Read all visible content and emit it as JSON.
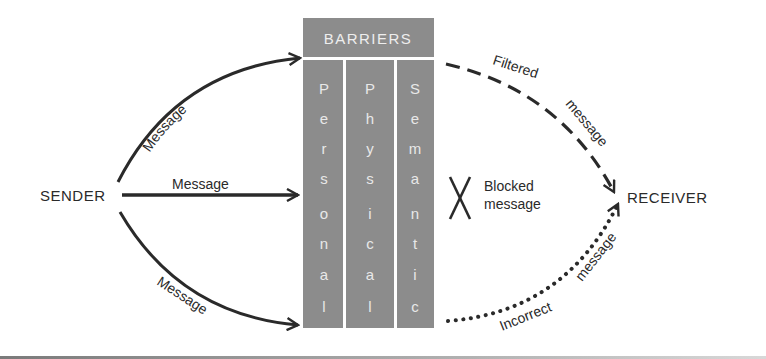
{
  "colors": {
    "barrier_fill": "#8c8c8c",
    "barrier_text": "#e8e8e8",
    "ink": "#2a2a2a",
    "background": "#ffffff"
  },
  "nodes": {
    "sender": "SENDER",
    "receiver": "RECEIVER"
  },
  "barriers": {
    "title": "BARRIERS",
    "columns": [
      {
        "name": "Personal",
        "letters": [
          "P",
          "e",
          "r",
          "s",
          "o",
          "n",
          "a",
          "l"
        ]
      },
      {
        "name": "Physical",
        "letters": [
          "P",
          "h",
          "y",
          "s",
          "i",
          "c",
          "a",
          "l"
        ]
      },
      {
        "name": "Semantic",
        "letters": [
          "S",
          "e",
          "m",
          "a",
          "n",
          "t",
          "i",
          "c"
        ]
      }
    ]
  },
  "arrows": {
    "top_message": "Message",
    "middle_message": "Message",
    "bottom_message": "Message",
    "filtered_word1": "Filtered",
    "filtered_word2": "message",
    "blocked_word1": "Blocked",
    "blocked_word2": "message",
    "incorrect_word1": "Incorrect",
    "incorrect_word2": "message"
  },
  "legend": {
    "filtered_style": "dashed",
    "incorrect_style": "dotted",
    "blocked_symbol": "X"
  }
}
